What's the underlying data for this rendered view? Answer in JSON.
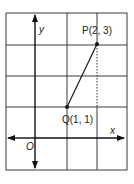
{
  "diagram": {
    "type": "coordinate-grid",
    "axes": {
      "x_label": "x",
      "y_label": "y",
      "origin_label": "O"
    },
    "points": [
      {
        "id": "P",
        "label": "P(2, 3)",
        "x": 2,
        "y": 3
      },
      {
        "id": "Q",
        "label": "Q(1, 1)",
        "x": 1,
        "y": 1
      }
    ],
    "segment": {
      "from": "Q",
      "to": "P"
    },
    "dashed_line": {
      "description": "vertical dashed line from P down to level of Q at x = 2"
    },
    "grid": {
      "x_range": [
        -1,
        3
      ],
      "y_range": [
        -1,
        4
      ],
      "unit_step": 1
    },
    "colors": {
      "line": "#1a1a1a",
      "grid": "#3a3a3a",
      "background": "#ffffff"
    }
  }
}
